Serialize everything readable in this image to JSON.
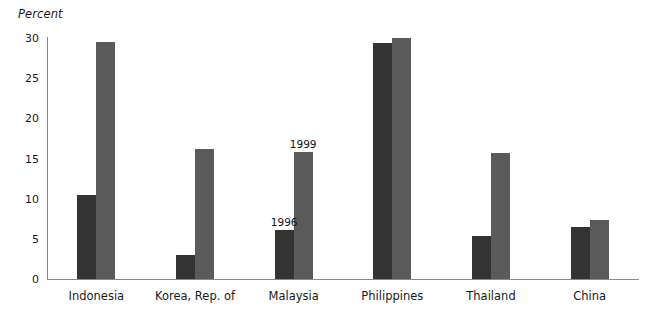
{
  "chart_data": {
    "type": "bar",
    "title": "",
    "subtitle": "",
    "xlabel": "",
    "ylabel": "Percent",
    "ylim": [
      0,
      30
    ],
    "yticks": [
      0,
      5,
      10,
      15,
      20,
      25,
      30
    ],
    "grid": false,
    "legend_position": "none",
    "categories": [
      "Indonesia",
      "Korea, Rep. of",
      "Malaysia",
      "Philippines",
      "Thailand",
      "China"
    ],
    "series": [
      {
        "name": "1996",
        "color": "#333333",
        "values": [
          10.5,
          3.0,
          6.1,
          29.4,
          5.4,
          6.5
        ]
      },
      {
        "name": "1999",
        "color": "#5a5a5a",
        "values": [
          29.5,
          16.2,
          15.8,
          30.0,
          15.7,
          7.4
        ]
      }
    ],
    "annotations": [
      {
        "text": "1996",
        "category": "Malaysia",
        "series": "1996"
      },
      {
        "text": "1999",
        "category": "Malaysia",
        "series": "1999"
      }
    ]
  }
}
